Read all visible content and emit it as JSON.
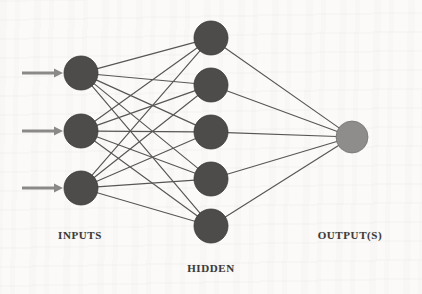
{
  "figure": {
    "background_color": "#fbfaf8",
    "width": 422,
    "height": 294
  },
  "palette": {
    "node_dark": "#4d4c4b",
    "node_dark_stroke": "#3a3938",
    "node_light": "#8e8d8b",
    "node_light_stroke": "#757472",
    "edge": "#585654",
    "arrow": "#8a8987",
    "label_text": "#3d3b39"
  },
  "labels": [
    {
      "id": "inputs",
      "text": "INPUTS",
      "x": 80,
      "y": 229
    },
    {
      "id": "hidden",
      "text": "HIDDEN",
      "x": 211,
      "y": 262
    },
    {
      "id": "outputs",
      "text": "OUTPUT(S)",
      "x": 350,
      "y": 229
    }
  ],
  "layers": [
    {
      "id": "input",
      "name": "Input Layer",
      "label": "INPUTS",
      "node_count": 3,
      "radius": 17,
      "fill": "#4d4c4b",
      "nodes": [
        {
          "id": "i1",
          "x": 81,
          "y": 73
        },
        {
          "id": "i2",
          "x": 81,
          "y": 131
        },
        {
          "id": "i3",
          "x": 81,
          "y": 188
        }
      ]
    },
    {
      "id": "hidden",
      "name": "Hidden Layer",
      "label": "HIDDEN",
      "node_count": 5,
      "radius": 17,
      "fill": "#4d4c4b",
      "nodes": [
        {
          "id": "h1",
          "x": 211,
          "y": 38
        },
        {
          "id": "h2",
          "x": 211,
          "y": 85
        },
        {
          "id": "h3",
          "x": 211,
          "y": 132
        },
        {
          "id": "h4",
          "x": 211,
          "y": 179
        },
        {
          "id": "h5",
          "x": 211,
          "y": 226
        }
      ]
    },
    {
      "id": "output",
      "name": "Output Layer",
      "label": "OUTPUT(S)",
      "node_count": 1,
      "radius": 16,
      "fill": "#8e8d8b",
      "nodes": [
        {
          "id": "o1",
          "x": 352,
          "y": 137
        }
      ]
    }
  ],
  "input_arrows": [
    {
      "id": "a1",
      "x1": 22,
      "x2": 63,
      "y": 73
    },
    {
      "id": "a2",
      "x1": 22,
      "x2": 63,
      "y": 131
    },
    {
      "id": "a3",
      "x1": 22,
      "x2": 63,
      "y": 188
    }
  ],
  "connections": {
    "input_to_hidden": "full",
    "hidden_to_output": "full",
    "input_to_hidden_count": 15,
    "hidden_to_output_count": 5
  }
}
